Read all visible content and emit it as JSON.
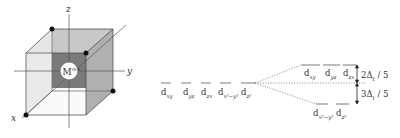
{
  "cube": {
    "axis_labels": {
      "x": "x",
      "y": "y",
      "z": "z"
    },
    "center_ion": "M",
    "center_ion_charge": "m+"
  },
  "splitting": {
    "degenerate_labels": [
      "d",
      "d",
      "d",
      "d",
      "d"
    ],
    "degenerate_subscripts": [
      "xy",
      "yz",
      "zx",
      "x²−y²",
      "z²"
    ],
    "upper_labels": [
      "d",
      "d",
      "d"
    ],
    "upper_subscripts": [
      "xy",
      "yz",
      "zx"
    ],
    "lower_labels": [
      "d",
      "d"
    ],
    "lower_subscripts": [
      "x²−y²",
      "z²"
    ],
    "upper_energy": "2Δ",
    "upper_energy_sub": "t",
    "upper_energy_frac": " / 5",
    "lower_energy": "3Δ",
    "lower_energy_sub": "t",
    "lower_energy_frac": " / 5"
  }
}
